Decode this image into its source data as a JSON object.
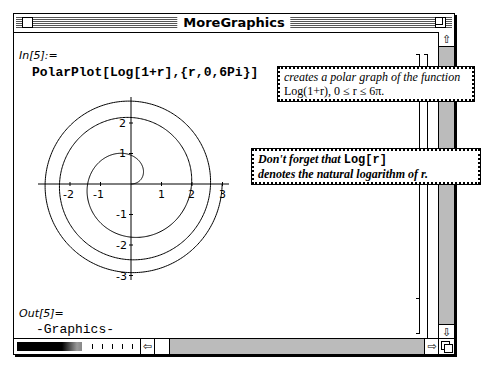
{
  "window": {
    "title": "MoreGraphics"
  },
  "notebook": {
    "input_label": "In[5]:=",
    "input_code": "PolarPlot[Log[1+r],{r,0,6Pi}]",
    "output_label": "Out[5]=",
    "output_value": "-Graphics-"
  },
  "notes": {
    "note1_line1": "creates a polar graph of the function",
    "note1_line2": "Log(1+r),  0  ≤  r  ≤  6π.",
    "note2_prefix": "Don't forget that ",
    "note2_code": "Log[r]",
    "note2_line2": "denotes the natural logarithm of r."
  },
  "scrollbars": {
    "up_arrow": "⇧",
    "down_arrow": "⇩",
    "left_arrow": "⇦",
    "right_arrow": "⇨"
  },
  "chart_data": {
    "type": "line",
    "title": "",
    "function": "r = Log(1+t), 0 ≤ t ≤ 6π (polar)",
    "xlabel": "",
    "ylabel": "",
    "x_ticks": [
      "-2",
      "-1",
      "1",
      "2",
      "3"
    ],
    "y_ticks": [
      "2",
      "1",
      "-1",
      "-2",
      "-3"
    ],
    "xlim": [
      -2.9,
      3.1
    ],
    "ylim": [
      -3.0,
      2.9
    ],
    "grid": false,
    "t_range": [
      0,
      18.85
    ],
    "max_radius": 2.99
  }
}
